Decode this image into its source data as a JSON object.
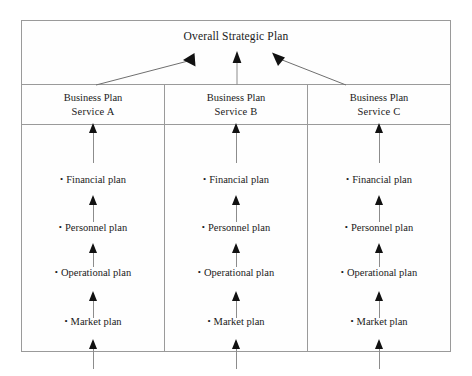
{
  "diagram": {
    "title": "Overall Strategic Plan",
    "bullet_glyph": "•",
    "frame_color": "#9a9a9a",
    "arrow_color": "#111111",
    "stem_color": "#8c8c8c",
    "columns": [
      {
        "header_line1": "Business Plan",
        "header_line2": "Service A",
        "items": [
          {
            "label": "Financial plan"
          },
          {
            "label": "Personnel plan"
          },
          {
            "label": "Operational plan"
          },
          {
            "label": "Market plan"
          }
        ]
      },
      {
        "header_line1": "Business Plan",
        "header_line2": "Service B",
        "items": [
          {
            "label": "Financial plan"
          },
          {
            "label": "Personnel plan"
          },
          {
            "label": "Operational plan"
          },
          {
            "label": "Market plan"
          }
        ]
      },
      {
        "header_line1": "Business Plan",
        "header_line2": "Service C",
        "items": [
          {
            "label": "Financial plan"
          },
          {
            "label": "Personnel plan"
          },
          {
            "label": "Operational plan"
          },
          {
            "label": "Market plan"
          }
        ]
      }
    ],
    "connectors": {
      "left_diagonal": "business-plan-a-to-overall-plan",
      "center_vertical": "business-plan-b-to-overall-plan",
      "right_diagonal": "business-plan-c-to-overall-plan"
    }
  }
}
